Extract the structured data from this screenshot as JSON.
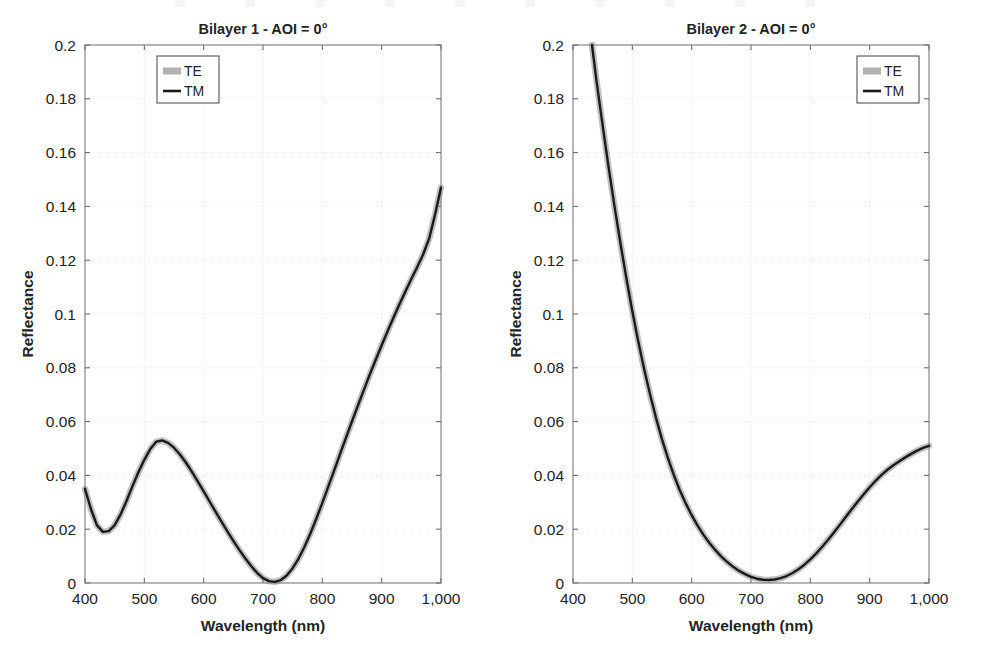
{
  "figure": {
    "background": "#ffffff",
    "panel_count": 2
  },
  "chart_data": [
    {
      "type": "line",
      "title": "Bilayer 1 - AOI = 0°",
      "xlabel": "Wavelength (nm)",
      "ylabel": "Reflectance",
      "xlim": [
        400,
        1000
      ],
      "ylim": [
        0,
        0.2
      ],
      "xticks": [
        400,
        500,
        600,
        700,
        800,
        900,
        1000
      ],
      "xticklabels": [
        "400",
        "500",
        "600",
        "700",
        "800",
        "900",
        "1,000"
      ],
      "yticks": [
        0,
        0.02,
        0.04,
        0.06,
        0.08,
        0.1,
        0.12,
        0.14,
        0.16,
        0.18,
        0.2
      ],
      "yticklabels": [
        "0",
        "0.02",
        "0.04",
        "0.06",
        "0.08",
        "0.1",
        "0.12",
        "0.14",
        "0.16",
        "0.18",
        "0.2"
      ],
      "grid": true,
      "legend": {
        "position": "top-left",
        "entries": [
          {
            "name": "TE",
            "style": "thick-gray-band",
            "color": "#8c8c8c"
          },
          {
            "name": "TM",
            "style": "solid-line",
            "color": "#1a1a1a"
          }
        ]
      },
      "series": [
        {
          "name": "TE",
          "color": "#8c8c8c",
          "x": [
            400,
            410,
            420,
            430,
            440,
            450,
            460,
            470,
            480,
            490,
            500,
            510,
            520,
            530,
            540,
            550,
            560,
            570,
            580,
            590,
            600,
            610,
            620,
            630,
            640,
            650,
            660,
            670,
            680,
            690,
            700,
            710,
            720,
            730,
            740,
            750,
            760,
            770,
            780,
            790,
            800,
            810,
            820,
            830,
            840,
            850,
            860,
            870,
            880,
            890,
            900,
            910,
            920,
            930,
            940,
            950,
            960,
            970,
            980,
            990,
            1000
          ],
          "values": [
            0.035,
            0.0275,
            0.0215,
            0.019,
            0.0193,
            0.0215,
            0.0255,
            0.0305,
            0.036,
            0.0412,
            0.0458,
            0.0498,
            0.0525,
            0.053,
            0.0521,
            0.0503,
            0.0478,
            0.0448,
            0.0414,
            0.0378,
            0.0341,
            0.0303,
            0.0265,
            0.0228,
            0.0192,
            0.0157,
            0.0123,
            0.0092,
            0.0063,
            0.0038,
            0.0018,
            0.0007,
            0.0004,
            0.0011,
            0.0028,
            0.0055,
            0.0091,
            0.0135,
            0.0185,
            0.024,
            0.0298,
            0.0358,
            0.0419,
            0.048,
            0.0541,
            0.0601,
            0.066,
            0.0718,
            0.0775,
            0.083,
            0.0884,
            0.0936,
            0.0987,
            0.1036,
            0.1084,
            0.113,
            0.1175,
            0.1222,
            0.128,
            0.137,
            0.147
          ]
        },
        {
          "name": "TM",
          "color": "#1a1a1a",
          "x": [
            400,
            410,
            420,
            430,
            440,
            450,
            460,
            470,
            480,
            490,
            500,
            510,
            520,
            530,
            540,
            550,
            560,
            570,
            580,
            590,
            600,
            610,
            620,
            630,
            640,
            650,
            660,
            670,
            680,
            690,
            700,
            710,
            720,
            730,
            740,
            750,
            760,
            770,
            780,
            790,
            800,
            810,
            820,
            830,
            840,
            850,
            860,
            870,
            880,
            890,
            900,
            910,
            920,
            930,
            940,
            950,
            960,
            970,
            980,
            990,
            1000
          ],
          "values": [
            0.035,
            0.0275,
            0.0215,
            0.019,
            0.0193,
            0.0215,
            0.0255,
            0.0305,
            0.036,
            0.0412,
            0.0458,
            0.0498,
            0.0525,
            0.053,
            0.0521,
            0.0503,
            0.0478,
            0.0448,
            0.0414,
            0.0378,
            0.0341,
            0.0303,
            0.0265,
            0.0228,
            0.0192,
            0.0157,
            0.0123,
            0.0092,
            0.0063,
            0.0038,
            0.0018,
            0.0007,
            0.0004,
            0.0011,
            0.0028,
            0.0055,
            0.0091,
            0.0135,
            0.0185,
            0.024,
            0.0298,
            0.0358,
            0.0419,
            0.048,
            0.0541,
            0.0601,
            0.066,
            0.0718,
            0.0775,
            0.083,
            0.0884,
            0.0936,
            0.0987,
            0.1036,
            0.1084,
            0.113,
            0.1175,
            0.1222,
            0.128,
            0.137,
            0.147
          ]
        }
      ],
      "annotations": [
        {
          "text": "local minimum ≈ 0.019 near 430 nm"
        },
        {
          "text": "local maximum ≈ 0.053 near 528 nm"
        },
        {
          "text": "global minimum ≈ 0.000 near 715 nm"
        },
        {
          "text": "endpoint ≈ 0.147 at 1,000 nm"
        }
      ]
    },
    {
      "type": "line",
      "title": "Bilayer 2 - AOI = 0°",
      "xlabel": "Wavelength (nm)",
      "ylabel": "Reflectance",
      "xlim": [
        400,
        1000
      ],
      "ylim": [
        0,
        0.2
      ],
      "xticks": [
        400,
        500,
        600,
        700,
        800,
        900,
        1000
      ],
      "xticklabels": [
        "400",
        "500",
        "600",
        "700",
        "800",
        "900",
        "1,000"
      ],
      "yticks": [
        0,
        0.02,
        0.04,
        0.06,
        0.08,
        0.1,
        0.12,
        0.14,
        0.16,
        0.18,
        0.2
      ],
      "yticklabels": [
        "0",
        "0.02",
        "0.04",
        "0.06",
        "0.08",
        "0.1",
        "0.12",
        "0.14",
        "0.16",
        "0.18",
        "0.2"
      ],
      "grid": true,
      "legend": {
        "position": "top-right",
        "entries": [
          {
            "name": "TE",
            "style": "thick-gray-band",
            "color": "#8c8c8c"
          },
          {
            "name": "TM",
            "style": "solid-line",
            "color": "#1a1a1a"
          }
        ]
      },
      "series": [
        {
          "name": "TE",
          "color": "#8c8c8c",
          "x": [
            432,
            440,
            450,
            460,
            470,
            480,
            490,
            500,
            510,
            520,
            530,
            540,
            550,
            560,
            570,
            580,
            590,
            600,
            610,
            620,
            630,
            640,
            650,
            660,
            670,
            680,
            690,
            700,
            710,
            720,
            730,
            740,
            750,
            760,
            770,
            780,
            790,
            800,
            810,
            820,
            830,
            840,
            850,
            860,
            870,
            880,
            890,
            900,
            910,
            920,
            930,
            940,
            950,
            960,
            970,
            980,
            990,
            1000
          ],
          "values": [
            0.2,
            0.186,
            0.17,
            0.1545,
            0.14,
            0.1262,
            0.1132,
            0.101,
            0.0898,
            0.0795,
            0.07,
            0.0613,
            0.0534,
            0.0464,
            0.0401,
            0.0345,
            0.0296,
            0.0252,
            0.0213,
            0.0179,
            0.0149,
            0.0122,
            0.0098,
            0.0078,
            0.006,
            0.0045,
            0.0033,
            0.0023,
            0.0016,
            0.0012,
            0.0011,
            0.0013,
            0.0018,
            0.0026,
            0.0037,
            0.0051,
            0.0068,
            0.0088,
            0.011,
            0.0135,
            0.0161,
            0.0189,
            0.0217,
            0.0246,
            0.0275,
            0.0303,
            0.033,
            0.0356,
            0.038,
            0.0402,
            0.0421,
            0.0438,
            0.0453,
            0.0467,
            0.048,
            0.0492,
            0.0502,
            0.051
          ]
        },
        {
          "name": "TM",
          "color": "#1a1a1a",
          "x": [
            432,
            440,
            450,
            460,
            470,
            480,
            490,
            500,
            510,
            520,
            530,
            540,
            550,
            560,
            570,
            580,
            590,
            600,
            610,
            620,
            630,
            640,
            650,
            660,
            670,
            680,
            690,
            700,
            710,
            720,
            730,
            740,
            750,
            760,
            770,
            780,
            790,
            800,
            810,
            820,
            830,
            840,
            850,
            860,
            870,
            880,
            890,
            900,
            910,
            920,
            930,
            940,
            950,
            960,
            970,
            980,
            990,
            1000
          ],
          "values": [
            0.2,
            0.186,
            0.17,
            0.1545,
            0.14,
            0.1262,
            0.1132,
            0.101,
            0.0898,
            0.0795,
            0.07,
            0.0613,
            0.0534,
            0.0464,
            0.0401,
            0.0345,
            0.0296,
            0.0252,
            0.0213,
            0.0179,
            0.0149,
            0.0122,
            0.0098,
            0.0078,
            0.006,
            0.0045,
            0.0033,
            0.0023,
            0.0016,
            0.0012,
            0.0011,
            0.0013,
            0.0018,
            0.0026,
            0.0037,
            0.0051,
            0.0068,
            0.0088,
            0.011,
            0.0135,
            0.0161,
            0.0189,
            0.0217,
            0.0246,
            0.0275,
            0.0303,
            0.033,
            0.0356,
            0.038,
            0.0402,
            0.0421,
            0.0438,
            0.0453,
            0.0467,
            0.048,
            0.0492,
            0.0502,
            0.051
          ]
        }
      ],
      "annotations": [
        {
          "text": "curve enters top of axes at 0.2 near 432 nm"
        },
        {
          "text": "global minimum ≈ 0.000 near 725 nm"
        },
        {
          "text": "endpoint ≈ 0.051 at 1,000 nm"
        }
      ]
    }
  ]
}
